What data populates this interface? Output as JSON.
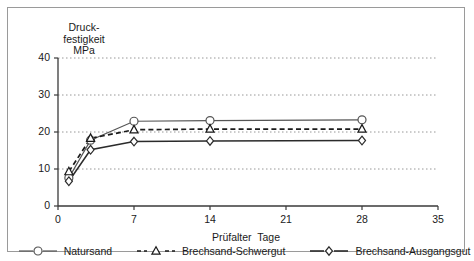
{
  "chart_data": {
    "type": "line",
    "title": "",
    "xlabel": "Prüfalter  Tage",
    "ylabel": "Druck-\nfestigkeit\nMPa",
    "ylabel_lines": [
      "Druck-",
      "festigkeit",
      "MPa"
    ],
    "xlim": [
      0,
      35
    ],
    "ylim": [
      0,
      40
    ],
    "xticks": [
      0,
      7,
      14,
      21,
      28,
      35
    ],
    "yticks": [
      0,
      10,
      20,
      30,
      40
    ],
    "xtick_labels": [
      "0",
      "7",
      "14",
      "21",
      "28",
      "35"
    ],
    "ytick_labels": [
      "0",
      "10",
      "20",
      "30",
      "40"
    ],
    "grid": "horizontal-dotted",
    "legend_position": "bottom",
    "x": [
      1,
      3,
      7,
      14,
      28
    ],
    "series": [
      {
        "name": "Natursand",
        "marker": "circle",
        "linestyle": "solid",
        "color": "#555555",
        "values": [
          7.6,
          17.8,
          22.9,
          23.1,
          23.3
        ]
      },
      {
        "name": "Brechsand-Schwergut",
        "marker": "triangle",
        "linestyle": "dashed",
        "color": "#1a1a1a",
        "values": [
          9.3,
          18.3,
          20.6,
          20.8,
          20.8
        ]
      },
      {
        "name": "Brechsand-Ausgangsgut",
        "marker": "diamond",
        "linestyle": "solid",
        "color": "#2b2b2b",
        "values": [
          6.7,
          15.2,
          17.4,
          17.6,
          17.7
        ]
      }
    ]
  },
  "axes": {
    "y_title_lines": [
      "Druck-",
      "festigkeit",
      "MPa"
    ],
    "x_title": "Prüfalter  Tage"
  },
  "legend": {
    "items": [
      {
        "label": "Natursand"
      },
      {
        "label": "Brechsand-Schwergut"
      },
      {
        "label": "Brechsand-Ausgangsgut"
      }
    ]
  }
}
